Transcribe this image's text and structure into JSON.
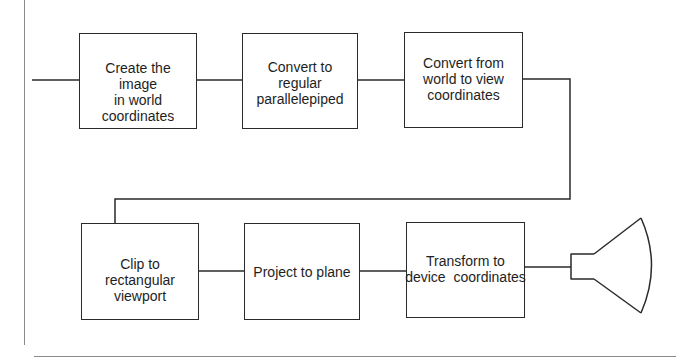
{
  "diagram": {
    "type": "flowchart",
    "title": "",
    "line_color": "#2a2a2a",
    "text_color": "#1e1e1e",
    "background": "#ffffff",
    "steps": [
      {
        "id": "create",
        "label": "Create the image\nin world\ncoordinates"
      },
      {
        "id": "parallelepiped",
        "label": "Convert to regular\nparallelepiped"
      },
      {
        "id": "world-to-view",
        "label": "Convert from\nworld to view\ncoordinates"
      },
      {
        "id": "clip",
        "label": "Clip to rectangular\nviewport"
      },
      {
        "id": "project",
        "label": "Project to plane"
      },
      {
        "id": "transform",
        "label": "Transform to\ndevice  coordinates"
      }
    ],
    "output_device": {
      "icon": "crt-display-icon"
    },
    "edges": [
      {
        "from": "input",
        "to": "create"
      },
      {
        "from": "create",
        "to": "parallelepiped"
      },
      {
        "from": "parallelepiped",
        "to": "world-to-view"
      },
      {
        "from": "world-to-view",
        "to": "clip"
      },
      {
        "from": "clip",
        "to": "project"
      },
      {
        "from": "project",
        "to": "transform"
      },
      {
        "from": "transform",
        "to": "crt-display"
      }
    ]
  }
}
